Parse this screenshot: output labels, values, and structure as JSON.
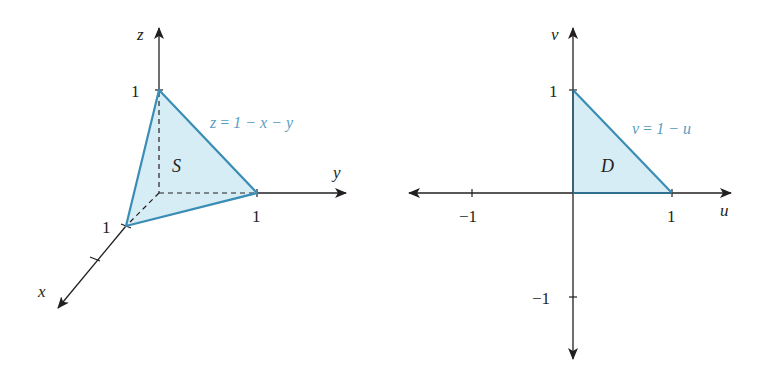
{
  "colors": {
    "axis": "#231f20",
    "region_fill": "#d6edf5",
    "region_edge": "#3a8db5",
    "equation_text": "#5a9ec2"
  },
  "left_figure": {
    "type": "3d-surface",
    "axes": {
      "x_label": "x",
      "y_label": "y",
      "z_label": "z"
    },
    "ticks": {
      "x_one": "1",
      "y_one": "1",
      "z_one": "1"
    },
    "region_label": "S",
    "surface_equation": {
      "lhs": "z",
      "eq": "=",
      "rhs": "1 − x − y"
    },
    "vertices": [
      {
        "name": "x-intercept",
        "coords": [
          1,
          0,
          0
        ]
      },
      {
        "name": "y-intercept",
        "coords": [
          0,
          1,
          0
        ]
      },
      {
        "name": "z-intercept",
        "coords": [
          0,
          0,
          1
        ]
      }
    ]
  },
  "right_figure": {
    "type": "2d-region",
    "axes": {
      "u_label": "u",
      "v_label": "v"
    },
    "ticks": {
      "u_neg_one": "−1",
      "u_one": "1",
      "v_one": "1",
      "v_neg_one": "−1"
    },
    "region_label": "D",
    "boundary_equation": {
      "lhs": "v",
      "eq": "=",
      "rhs": "1 − u"
    },
    "vertices": [
      {
        "name": "origin",
        "coords": [
          0,
          0
        ]
      },
      {
        "name": "u-intercept",
        "coords": [
          1,
          0
        ]
      },
      {
        "name": "v-intercept",
        "coords": [
          0,
          1
        ]
      }
    ]
  }
}
